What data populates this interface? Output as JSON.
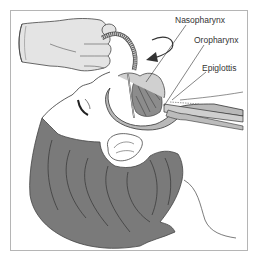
{
  "figure": {
    "labels": {
      "nasopharynx": "Nasopharynx",
      "oropharynx": "Oropharynx",
      "epiglottis": "Epiglottis"
    },
    "colors": {
      "frame": "#b5b5b5",
      "glove": "#e4e4e4",
      "hair": "#7a7a7a",
      "tissue": "#b9b9b9",
      "pharynx_dark": "#8c8c8c",
      "line": "#3a3a3a",
      "background": "#ffffff"
    }
  }
}
